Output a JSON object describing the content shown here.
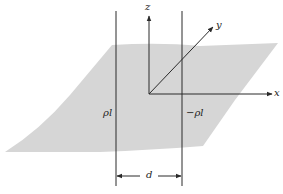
{
  "figure": {
    "colors": {
      "plane": "#d6d6d6",
      "lines": "#2a2a2a",
      "background": "#ffffff"
    }
  },
  "axes": {
    "x_label": "x",
    "y_label": "y",
    "z_label": "z"
  },
  "charges": {
    "left_label": "ρl",
    "right_label": "−ρl"
  },
  "dimension": {
    "separation_label": "d"
  }
}
